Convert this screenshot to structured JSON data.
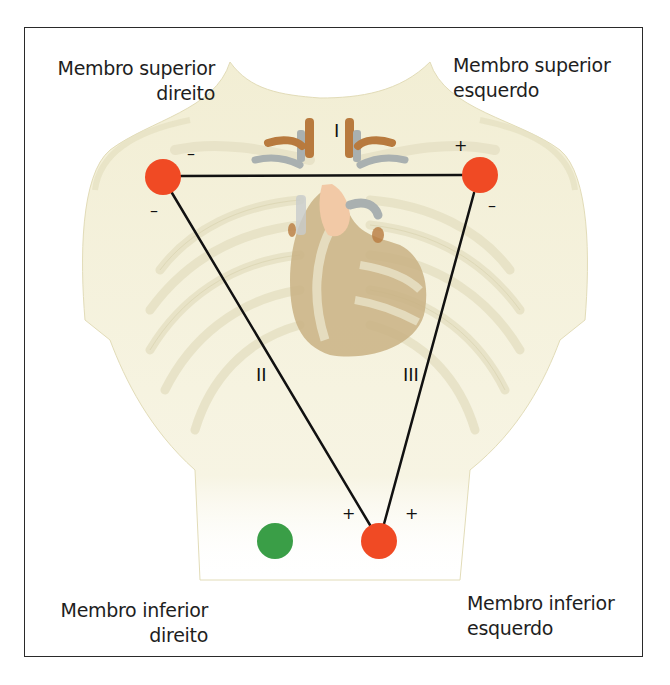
{
  "diagram": {
    "type": "einthoven-triangle",
    "labels": {
      "right_arm": {
        "line1": "Membro superior",
        "line2": "direito"
      },
      "left_arm": {
        "line1": "Membro superior",
        "line2": "esquerdo"
      },
      "right_leg": {
        "line1": "Membro inferior",
        "line2": "direito"
      },
      "left_leg": {
        "line1": "Membro inferior",
        "line2": "esquerdo"
      }
    },
    "leads": {
      "I": "I",
      "II": "II",
      "III": "III"
    },
    "polarity": {
      "lead_I_right_arm": "–",
      "lead_I_left_arm": "+",
      "lead_II_right_arm": "–",
      "lead_III_left_arm": "–",
      "lead_II_left_leg": "+",
      "lead_III_left_leg": "+"
    },
    "electrodes": [
      {
        "name": "right-arm",
        "cx": 163,
        "cy": 177,
        "r": 18,
        "color": "#f04a24"
      },
      {
        "name": "left-arm",
        "cx": 480,
        "cy": 175,
        "r": 18,
        "color": "#f04a24"
      },
      {
        "name": "left-leg",
        "cx": 379,
        "cy": 541,
        "r": 18,
        "color": "#f04a24"
      },
      {
        "name": "right-leg-ground",
        "cx": 275,
        "cy": 541,
        "r": 18,
        "color": "#3a9e47"
      }
    ],
    "colors": {
      "electrode_active": "#f04a24",
      "electrode_ground": "#3a9e47",
      "line": "#111111",
      "skin": "#f3efd6",
      "heart": "#b9a070",
      "aorta": "#f2c9a6",
      "vessel": "#b87a3e"
    }
  }
}
